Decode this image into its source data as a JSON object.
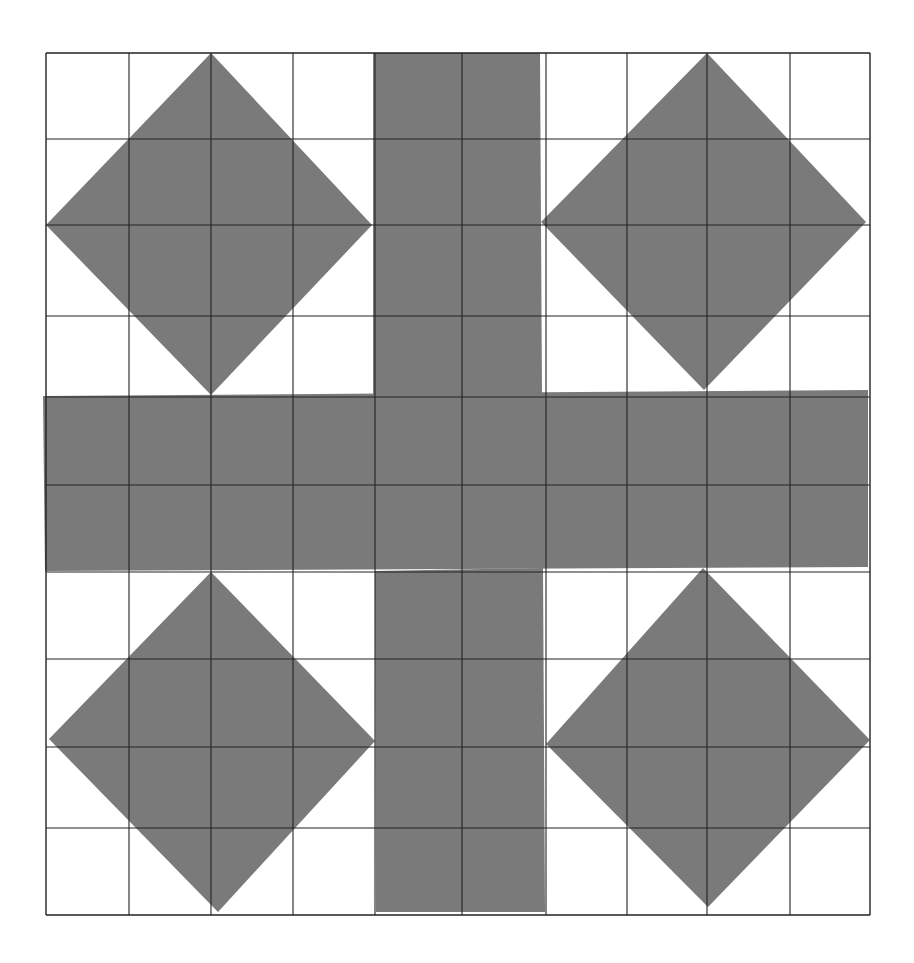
{
  "figure": {
    "colors": {
      "background": "#ffffff",
      "fill": "#7a7a7a",
      "grid_line": "#222222"
    },
    "grid": {
      "columns": 10,
      "rows": 10,
      "x_lines": [
        46,
        129,
        211,
        293,
        375,
        462,
        546,
        627,
        707,
        790,
        870
      ],
      "y_lines": [
        53,
        139,
        225,
        316,
        397,
        485,
        572,
        659,
        747,
        828,
        915
      ]
    },
    "shapes": {
      "cross_vertical_top": {
        "points": [
          [
            373,
            53
          ],
          [
            540,
            53
          ],
          [
            542,
            396
          ],
          [
            373,
            396
          ]
        ]
      },
      "cross_horizontal": {
        "points": [
          [
            43,
            396
          ],
          [
            868,
            390
          ],
          [
            868,
            567
          ],
          [
            45,
            571
          ]
        ]
      },
      "cross_vertical_bottom": {
        "points": [
          [
            375,
            571
          ],
          [
            543,
            568
          ],
          [
            545,
            912
          ],
          [
            376,
            912
          ]
        ]
      },
      "diamonds": [
        {
          "name": "top-left",
          "points": [
            [
              211,
              53
            ],
            [
              372,
              225
            ],
            [
              211,
              395
            ],
            [
              46,
              225
            ]
          ]
        },
        {
          "name": "top-right",
          "points": [
            [
              707,
              53
            ],
            [
              866,
              222
            ],
            [
              704,
              390
            ],
            [
              541,
              222
            ]
          ]
        },
        {
          "name": "bottom-left",
          "points": [
            [
              211,
              572
            ],
            [
              375,
              741
            ],
            [
              218,
              912
            ],
            [
              49,
              739
            ]
          ]
        },
        {
          "name": "bottom-right",
          "points": [
            [
              703,
              568
            ],
            [
              870,
              740
            ],
            [
              708,
              907
            ],
            [
              546,
              744
            ]
          ]
        }
      ]
    }
  }
}
